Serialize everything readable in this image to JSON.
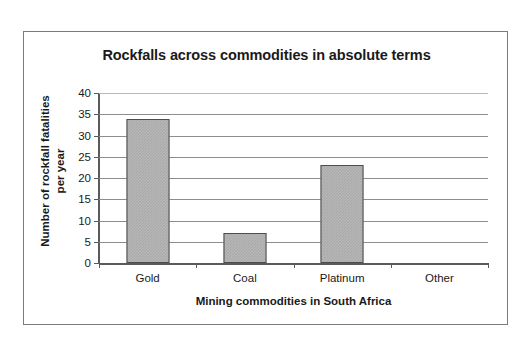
{
  "chart_data": {
    "type": "bar",
    "title": "Rockfalls across commodities in absolute terms",
    "xlabel": "Mining commodities in South Africa",
    "ylabel_line1": "Number of rockfall fatalities",
    "ylabel_line2": "per year",
    "categories": [
      "Gold",
      "Coal",
      "Platinum",
      "Other"
    ],
    "values": [
      34,
      7,
      23,
      0
    ],
    "yticks": [
      40,
      35,
      30,
      25,
      20,
      15,
      10,
      5,
      0
    ],
    "ylim": [
      0,
      40
    ],
    "grid": true,
    "legend": "none",
    "bar_color": "#a9a9a9",
    "bar_border_color": "#4d4d4d",
    "gridline_color": "#8d8d8d",
    "axis_color": "#5a5a5a",
    "background": "#ffffff",
    "frame_border_color": "#7a7a7a"
  }
}
